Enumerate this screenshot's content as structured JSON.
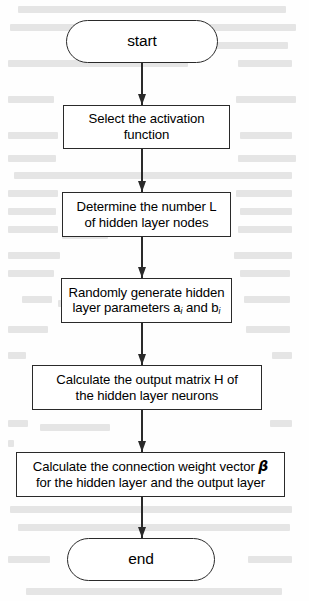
{
  "figure": {
    "type": "flowchart",
    "orientation": "top-to-bottom",
    "center_axis_x": 142,
    "line_color": "#2a2a2a",
    "background_color": "#fefefe",
    "nodes": [
      {
        "id": "start",
        "shape": "terminal",
        "text": "start",
        "x": 66,
        "y": 20,
        "width": 152,
        "height": 43
      },
      {
        "id": "select-activation",
        "shape": "process",
        "text": "Select the activation\nfunction",
        "x": 63,
        "y": 105,
        "width": 167,
        "height": 44
      },
      {
        "id": "determine-hidden-nodes",
        "shape": "process",
        "text": "Determine the number L\nof hidden layer nodes",
        "x": 62,
        "y": 192,
        "width": 169,
        "height": 45
      },
      {
        "id": "random-hidden-params",
        "shape": "process",
        "text": "Randomly generate hidden\nlayer parameters a_i and b_i",
        "x": 61,
        "y": 278,
        "width": 171,
        "height": 45
      },
      {
        "id": "calculate-output-matrix",
        "shape": "process",
        "text": "Calculate the output matrix H of\nthe hidden layer neurons",
        "x": 32,
        "y": 365,
        "width": 230,
        "height": 45
      },
      {
        "id": "calculate-weight-vector",
        "shape": "process",
        "text": "Calculate the connection weight vector β\nfor the hidden layer and the output layer",
        "x": 16,
        "y": 452,
        "width": 269,
        "height": 45
      },
      {
        "id": "end",
        "shape": "terminal",
        "text": "end",
        "x": 67,
        "y": 538,
        "width": 148,
        "height": 43
      }
    ],
    "edges": [
      {
        "id": "edge-start-to-select",
        "from": "start",
        "to": "select-activation",
        "y_top": 63,
        "y_bottom": 105
      },
      {
        "id": "edge-select-to-determine",
        "from": "select-activation",
        "to": "determine-hidden-nodes",
        "y_top": 149,
        "y_bottom": 192
      },
      {
        "id": "edge-determine-to-random",
        "from": "determine-hidden-nodes",
        "to": "random-hidden-params",
        "y_top": 237,
        "y_bottom": 278
      },
      {
        "id": "edge-random-to-matrix",
        "from": "random-hidden-params",
        "to": "calculate-output-matrix",
        "y_top": 323,
        "y_bottom": 365
      },
      {
        "id": "edge-matrix-to-weight",
        "from": "calculate-output-matrix",
        "to": "calculate-weight-vector",
        "y_top": 410,
        "y_bottom": 452
      },
      {
        "id": "edge-weight-to-end",
        "from": "calculate-weight-vector",
        "to": "end",
        "y_top": 497,
        "y_bottom": 538
      }
    ]
  },
  "labels": {
    "start": "start",
    "select_activation_line1": "Select the activation",
    "select_activation_line2": "function",
    "determine_nodes_line1": "Determine the number L",
    "determine_nodes_line2": "of hidden layer nodes",
    "random_params_line1": "Randomly generate hidden",
    "random_params_line2_a": "layer parameters a",
    "random_params_sub_a": "i",
    "random_params_line2_b": " and b",
    "random_params_sub_b": "i",
    "output_matrix_line1": "Calculate the output matrix H of",
    "output_matrix_line2": "the hidden layer neurons",
    "weight_vector_line1_a": "Calculate the connection weight vector ",
    "weight_vector_beta": "β",
    "weight_vector_line2": "for the hidden layer and the output layer",
    "end": "end"
  },
  "background_artifact": {
    "description": "faint mirrored show-through text from the reverse page of the scan",
    "legible": false
  }
}
